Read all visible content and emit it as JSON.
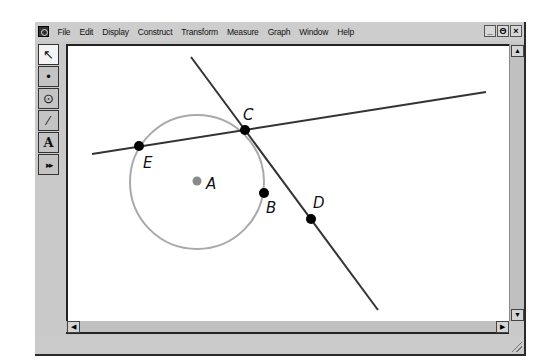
{
  "menubar": {
    "items": [
      "File",
      "Edit",
      "Display",
      "Construct",
      "Transform",
      "Measure",
      "Graph",
      "Window",
      "Help"
    ],
    "window_controls": {
      "minimize": "_",
      "restore": "Θ",
      "close": "×"
    }
  },
  "toolbox": {
    "tools": [
      {
        "name": "selection-arrow-tool",
        "glyph": "↖",
        "active": true
      },
      {
        "name": "point-tool",
        "glyph": "•",
        "active": false
      },
      {
        "name": "compass-tool",
        "glyph": "⊙",
        "active": false
      },
      {
        "name": "straightedge-tool",
        "glyph": "∕",
        "active": false
      },
      {
        "name": "text-tool",
        "glyph": "A",
        "active": false
      },
      {
        "name": "custom-tool",
        "glyph": "▸▸",
        "active": false
      }
    ]
  },
  "scrollbars": {
    "up": "▲",
    "down": "▼",
    "left": "◀",
    "right": "▶"
  },
  "sketch": {
    "points": [
      {
        "label": "A",
        "x": 197,
        "y": 181,
        "color": "#8a8a8a",
        "label_x": 206,
        "label_y": 189
      },
      {
        "label": "B",
        "x": 264,
        "y": 193,
        "color": "#000000",
        "label_x": 266,
        "label_y": 213
      },
      {
        "label": "C",
        "x": 245,
        "y": 130,
        "color": "#000000",
        "label_x": 243,
        "label_y": 120
      },
      {
        "label": "D",
        "x": 311,
        "y": 219,
        "color": "#000000",
        "label_x": 313,
        "label_y": 208
      },
      {
        "label": "E",
        "x": 139,
        "y": 146,
        "color": "#000000",
        "label_x": 143,
        "label_y": 168
      }
    ],
    "circle": {
      "center": "A",
      "cx": 197,
      "cy": 182,
      "r": 67,
      "color": "#a9a9a9"
    },
    "lines": [
      {
        "name": "line-EC",
        "x1": 92,
        "y1": 154,
        "x2": 486,
        "y2": 92,
        "color": "#333333"
      },
      {
        "name": "line-CD",
        "x1": 191,
        "y1": 57,
        "x2": 378,
        "y2": 310,
        "color": "#333333"
      }
    ]
  }
}
